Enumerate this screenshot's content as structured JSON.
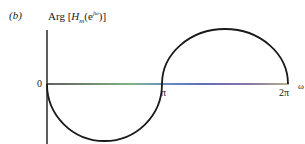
{
  "figure": {
    "part_label": "(b)",
    "title_prefix": "Arg [",
    "title_H": "H",
    "title_sub": "m",
    "title_open": "(e",
    "title_sup": "jω",
    "title_close": ")]"
  },
  "axes": {
    "origin_label": "0",
    "x_tick_pi": "π",
    "x_tick_2pi": "2π",
    "x_axis_label": "ω"
  },
  "colors": {
    "curve": "#1a1a1a",
    "axis": "#1a1a1a"
  }
}
